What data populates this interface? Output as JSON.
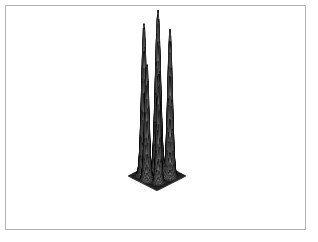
{
  "figure": {
    "title": "",
    "background_color": "#ffffff",
    "frame": {
      "visible": true,
      "color": "#b4b4b4",
      "x": 5,
      "y": 5,
      "width": 301,
      "height": 225
    }
  },
  "chart_data": {
    "type": "surface",
    "render_style": "wireframe-mesh-hidden-line",
    "title": "",
    "xlabel": "",
    "ylabel": "",
    "zlabel": "",
    "axes_visible": false,
    "ticks_visible": false,
    "grid": true,
    "legend": null,
    "line_color": "#000000",
    "surface_fill_color": "#ffffff",
    "mesh_nx": 52,
    "mesh_ny": 52,
    "xlim": [
      -3,
      3
    ],
    "ylim": [
      -3,
      3
    ],
    "zlim": [
      0,
      1
    ],
    "projection": {
      "kind": "oblique-isometric",
      "azimuth_deg": -37.5,
      "elevation_deg": 22,
      "origin_px": [
        157,
        176
      ],
      "x_axis_px": [
        4.82,
        2.45
      ],
      "y_axis_px": [
        -4.82,
        2.45
      ],
      "z_scale_px": 166
    },
    "function": "sum of 5 gaussian peaks",
    "peaks": [
      {
        "name": "peak-back-left",
        "cx": -1.55,
        "cy": 1.15,
        "amplitude": 0.92,
        "sigma_x": 0.34,
        "sigma_y": 0.34,
        "apex_px": [
          99,
          24
        ]
      },
      {
        "name": "peak-mid-left",
        "cx": -0.35,
        "cy": 1.75,
        "amplitude": 0.71,
        "sigma_x": 0.3,
        "sigma_y": 0.3,
        "apex_px": [
          123,
          58
        ]
      },
      {
        "name": "peak-center",
        "cx": 0.05,
        "cy": -0.15,
        "amplitude": 1.0,
        "sigma_x": 0.38,
        "sigma_y": 0.38,
        "apex_px": [
          154,
          12
        ]
      },
      {
        "name": "peak-mid-right",
        "cx": 1.35,
        "cy": 1.05,
        "amplitude": 0.66,
        "sigma_x": 0.27,
        "sigma_y": 0.27,
        "apex_px": [
          185,
          65
        ]
      },
      {
        "name": "peak-front-right",
        "cx": 1.45,
        "cy": -1.25,
        "amplitude": 0.89,
        "sigma_x": 0.33,
        "sigma_y": 0.33,
        "apex_px": [
          217,
          27
        ]
      }
    ],
    "base_plane_corners_px": {
      "left": [
        22,
        173
      ],
      "right": [
        294,
        173
      ],
      "front": [
        157,
        230
      ],
      "back": [
        157,
        117
      ]
    }
  }
}
